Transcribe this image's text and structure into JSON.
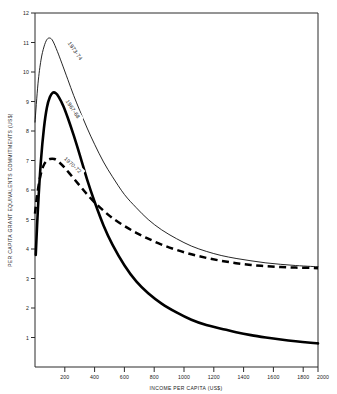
{
  "chart_data": {
    "type": "line",
    "title": "",
    "xlabel": "INCOME PER CAPITA (US$)",
    "ylabel": "PER CAPITA GRANT EQUIVALENTS COMMITMENTS (US$)",
    "xlim": [
      100,
      2000
    ],
    "ylim": [
      0,
      12
    ],
    "grid": false,
    "legend_position": "inline-curve-labels",
    "xticks": [
      200,
      400,
      600,
      800,
      1000,
      1200,
      1400,
      1600,
      1800,
      2000
    ],
    "xtick_labels": [
      "200",
      "400",
      "600",
      "800",
      "1000",
      "1200",
      "1400",
      "1600",
      "1800",
      "2000"
    ],
    "yticks": [
      1,
      2,
      3,
      4,
      5,
      6,
      7,
      8,
      9,
      10,
      11,
      12
    ],
    "ytick_labels": [
      "1",
      "2",
      "3",
      "4",
      "5",
      "6",
      "7",
      "8",
      "9",
      "10",
      "11",
      "12"
    ],
    "series": [
      {
        "name": "1973-74",
        "style": "bold-solid",
        "x": [
          100,
          120,
          140,
          160,
          180,
          200,
          220,
          250,
          280,
          320,
          360,
          400,
          450,
          500,
          560,
          620,
          700,
          780,
          860,
          950,
          1050,
          1150,
          1250,
          1350,
          1450,
          1550,
          1650,
          1750,
          1850,
          1950,
          2000
        ],
        "values": [
          8.3,
          9.6,
          10.4,
          10.85,
          11.1,
          11.15,
          11.05,
          10.7,
          10.3,
          9.75,
          9.2,
          8.7,
          8.1,
          7.55,
          6.95,
          6.45,
          5.85,
          5.4,
          5.0,
          4.65,
          4.35,
          4.1,
          3.92,
          3.78,
          3.68,
          3.6,
          3.53,
          3.48,
          3.44,
          3.41,
          3.4
        ]
      },
      {
        "name": "1967-68",
        "style": "thin-solid",
        "x": [
          105,
          120,
          140,
          160,
          180,
          200,
          220,
          240,
          260,
          290,
          320,
          360,
          400,
          450,
          500,
          560,
          620,
          700,
          780,
          860,
          950,
          1050,
          1150,
          1250,
          1350,
          1450,
          1550,
          1650,
          1750,
          1850,
          1950,
          2000
        ],
        "values": [
          3.8,
          5.4,
          7.0,
          8.1,
          8.8,
          9.15,
          9.3,
          9.28,
          9.15,
          8.85,
          8.45,
          7.85,
          7.2,
          6.35,
          5.6,
          4.8,
          4.15,
          3.45,
          2.9,
          2.5,
          2.15,
          1.85,
          1.6,
          1.42,
          1.3,
          1.18,
          1.08,
          1.0,
          0.93,
          0.87,
          0.82,
          0.8
        ]
      },
      {
        "name": "1970-72",
        "style": "dashed",
        "x": [
          100,
          115,
          135,
          155,
          175,
          200,
          230,
          260,
          300,
          350,
          400,
          450,
          500,
          560,
          620,
          700,
          780,
          860,
          950,
          1050,
          1150,
          1250,
          1350,
          1450,
          1550,
          1650,
          1750,
          1850,
          1950,
          2000
        ],
        "values": [
          5.2,
          5.85,
          6.45,
          6.8,
          6.97,
          7.05,
          7.05,
          6.95,
          6.75,
          6.45,
          6.15,
          5.85,
          5.58,
          5.3,
          5.05,
          4.78,
          4.55,
          4.35,
          4.15,
          3.97,
          3.82,
          3.7,
          3.6,
          3.52,
          3.46,
          3.42,
          3.39,
          3.37,
          3.36,
          3.35
        ]
      }
    ]
  },
  "axes": {
    "x_title": "INCOME PER CAPITA (US$)",
    "y_title": "PER CAPITA GRANT EQUIVALENTS COMMITMENTS (US$)"
  },
  "labels": {
    "series_1": "1973-74",
    "series_2": "1967-68",
    "series_3": "1970-72"
  },
  "ticks": {
    "y": [
      "12",
      "11",
      "10",
      "9",
      "8",
      "7",
      "6",
      "5",
      "4",
      "3",
      "2",
      "1"
    ],
    "x": [
      "200",
      "400",
      "600",
      "800",
      "1000",
      "1200",
      "1400",
      "1600",
      "1800",
      "2000"
    ]
  },
  "colors": {
    "ink": "#000000",
    "axis": "#2b2b2b",
    "background": "#ffffff"
  }
}
